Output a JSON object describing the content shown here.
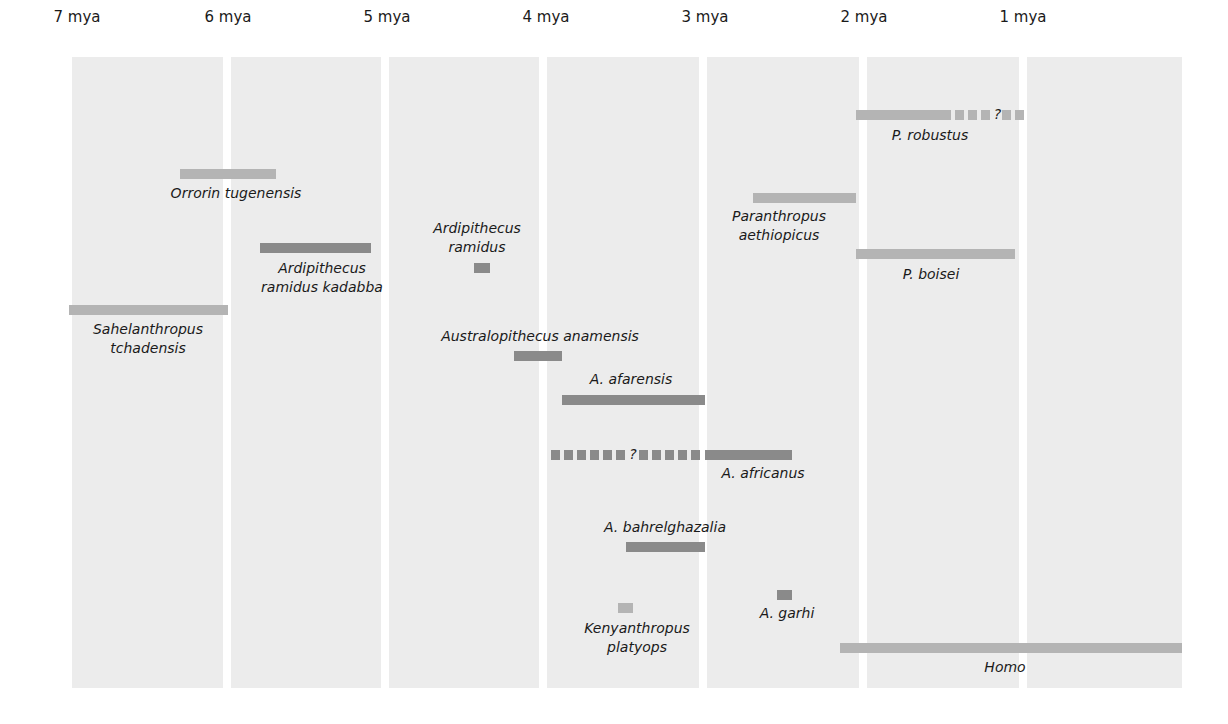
{
  "chart_data": {
    "type": "timeline",
    "title": "",
    "xlabel": "Millions of years ago (mya)",
    "x_axis": {
      "ticks": [
        "7 mya",
        "6 mya",
        "5 mya",
        "4 mya",
        "3 mya",
        "2 mya",
        "1 mya"
      ],
      "range_mya": [
        7,
        0
      ],
      "direction": "past-to-present left-to-right"
    },
    "colors": {
      "dark": "#8a8a8a",
      "light": "#b4b4b4",
      "panel": "#ececec"
    },
    "series": [
      {
        "name": "Sahelanthropus tchadensis",
        "label_lines": [
          "Sahelanthropus",
          "tchadensis"
        ],
        "start_mya": 7.0,
        "end_mya": 6.0,
        "shade": "light"
      },
      {
        "name": "Orrorin tugenensis",
        "label_lines": [
          "Orrorin tugenensis"
        ],
        "start_mya": 6.3,
        "end_mya": 5.7,
        "shade": "light"
      },
      {
        "name": "Ardipithecus ramidus kadabba",
        "label_lines": [
          "Ardipithecus",
          "ramidus kadabba"
        ],
        "start_mya": 5.8,
        "end_mya": 5.1,
        "shade": "dark"
      },
      {
        "name": "Ardipithecus ramidus",
        "label_lines": [
          "Ardipithecus",
          "ramidus"
        ],
        "start_mya": 4.45,
        "end_mya": 4.35,
        "shade": "dark"
      },
      {
        "name": "Australopithecus anamensis",
        "label_lines": [
          "Australopithecus anamensis"
        ],
        "start_mya": 4.2,
        "end_mya": 3.9,
        "shade": "dark"
      },
      {
        "name": "A. afarensis",
        "label_lines": [
          "A. afarensis"
        ],
        "start_mya": 3.9,
        "end_mya": 3.0,
        "shade": "dark"
      },
      {
        "name": "A. africanus",
        "label_lines": [
          "A. africanus"
        ],
        "start_mya": 3.0,
        "end_mya": 2.45,
        "uncertain_start_mya": 4.0,
        "uncertain_marker": "?",
        "shade": "dark"
      },
      {
        "name": "A. bahrelghazalia",
        "label_lines": [
          "A. bahrelghazalia"
        ],
        "start_mya": 3.5,
        "end_mya": 3.0,
        "shade": "dark"
      },
      {
        "name": "Kenyanthropus platyops",
        "label_lines": [
          "Kenyanthropus",
          "platyops"
        ],
        "start_mya": 3.55,
        "end_mya": 3.45,
        "shade": "light"
      },
      {
        "name": "A. garhi",
        "label_lines": [
          "A. garhi"
        ],
        "start_mya": 2.55,
        "end_mya": 2.45,
        "shade": "dark"
      },
      {
        "name": "Paranthropus aethiopicus",
        "label_lines": [
          "Paranthropus",
          "aethiopicus"
        ],
        "start_mya": 2.7,
        "end_mya": 2.05,
        "shade": "light"
      },
      {
        "name": "P. boisei",
        "label_lines": [
          "P. boisei"
        ],
        "start_mya": 2.05,
        "end_mya": 1.05,
        "shade": "light"
      },
      {
        "name": "P. robustus",
        "label_lines": [
          "P. robustus"
        ],
        "start_mya": 2.05,
        "end_mya": 1.45,
        "uncertain_end_mya": 1.0,
        "uncertain_marker": "?",
        "shade": "light"
      },
      {
        "name": "Homo",
        "label_lines": [
          "Homo"
        ],
        "start_mya": 2.15,
        "end_mya": 0.0,
        "shade": "light"
      }
    ],
    "grid": "alternating vertical panels per million years",
    "legend": "none"
  }
}
